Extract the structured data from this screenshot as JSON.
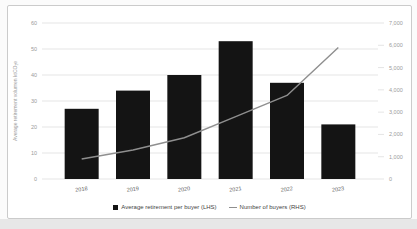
{
  "chart_data": {
    "type": "bar",
    "subtype": "combo-bar-line",
    "categories": [
      "2018",
      "2019",
      "2020",
      "2021",
      "2022",
      "2023"
    ],
    "series": [
      {
        "name": "Average retirement per buyer (LHS)",
        "type": "bar",
        "axis": "left",
        "color": "#141414",
        "values": [
          27,
          34,
          40,
          53,
          37,
          21
        ]
      },
      {
        "name": "Number of buyers (RHS)",
        "type": "line",
        "axis": "right",
        "color": "#8f8f8f",
        "values": [
          900,
          1300,
          1850,
          2800,
          3750,
          5900
        ]
      }
    ],
    "left_axis": {
      "label": "Average retirement volumen ktCO₂e",
      "min": 0,
      "max": 60,
      "step": 10
    },
    "right_axis": {
      "min": 0,
      "max": 7000,
      "step": 1000
    },
    "grid": true,
    "legend_position": "bottom",
    "colors": {
      "gridline": "#dedede",
      "tick_text": "#9b9b9b",
      "category_text": "#5a5a5a",
      "card_border": "#cbcbcb",
      "page_strip": "#e7e7e7"
    }
  }
}
